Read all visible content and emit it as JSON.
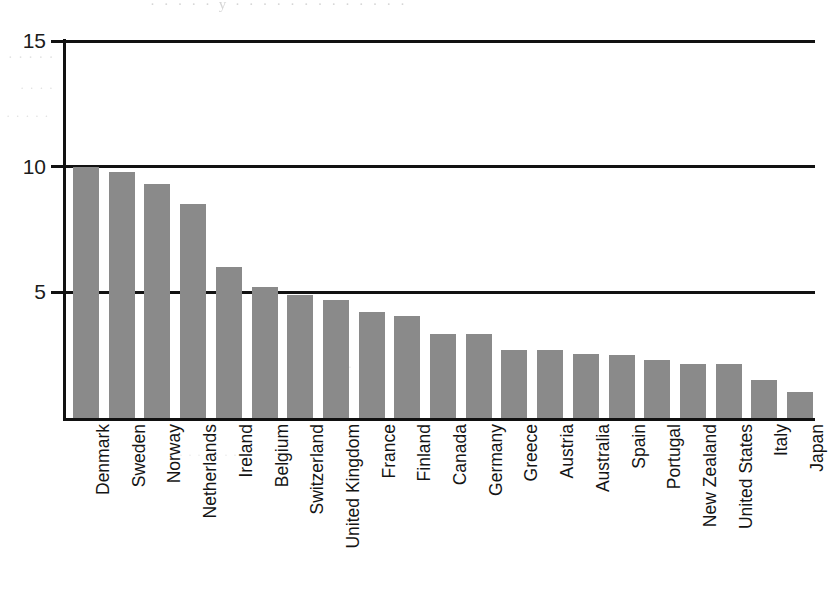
{
  "chart_data": {
    "type": "bar",
    "title": "",
    "subtitle": "",
    "xlabel": "",
    "ylabel": "",
    "ylim": [
      0,
      15
    ],
    "yticks": [
      5,
      10,
      15
    ],
    "ytick_labels": [
      "5",
      "10",
      "15"
    ],
    "grid": "horizontal",
    "legend": "none",
    "orientation": "vertical",
    "bar_color": "#8a8a8a",
    "axis_color": "#111111",
    "background": "#ffffff",
    "sorted": "descending",
    "categories": [
      "Denmark",
      "Sweden",
      "Norway",
      "Netherlands",
      "Ireland",
      "Belgium",
      "Switzerland",
      "United Kingdom",
      "France",
      "Finland",
      "Canada",
      "Germany",
      "Greece",
      "Austria",
      "Australia",
      "Spain",
      "Portugal",
      "New Zealand",
      "United States",
      "Italy",
      "Japan"
    ],
    "values": [
      10.0,
      9.8,
      9.3,
      8.5,
      6.0,
      5.2,
      4.9,
      4.7,
      4.2,
      4.05,
      3.35,
      3.35,
      2.7,
      2.7,
      2.55,
      2.5,
      2.3,
      2.15,
      2.15,
      1.5,
      1.05
    ]
  },
  "scan_artifacts": {
    "top_bleed": "·  ·  ·   ·  ·   y   ·  ·  ·   ·   ·    ·   ·  ·   ·   ·  ·    ·  ·",
    "left_bleed_a": "·  ·   ·  ·   ·",
    "left_bleed_b": "·   ·  ·  ·",
    "left_bleed_c": "·  ·   ·   ·  ·",
    "mid_bleed": "·   ·   ·",
    "bottom_bleed": "·    ·    ·     ·     ·    ·    ·    ·"
  }
}
